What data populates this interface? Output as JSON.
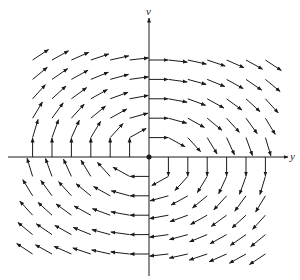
{
  "diagram": {
    "type": "vector_field",
    "title": "",
    "axes": {
      "horizontal_label": "y",
      "vertical_label": "v"
    },
    "colors": {
      "background": "#ffffff",
      "ink": "#1a1a1a"
    }
  },
  "chart_data": {
    "type": "vector_field",
    "title": "",
    "xlabel": "y",
    "ylabel": "v",
    "origin_px": [
      149,
      157
    ],
    "grid_spacing_px": 19.4,
    "grid_x_range": [
      -6,
      6
    ],
    "grid_v_range": [
      -5,
      5
    ],
    "arrow_length_px": 19,
    "field": "dy/dt = v, dv/dt = -0.55*y (clockwise rotation, elliptical orbits)",
    "field_coefficients": {
      "a": 1.0,
      "b": -0.55
    },
    "center_point": [
      0,
      0
    ],
    "grid": false,
    "axis_extent_px": {
      "x": [
        8,
        288
      ],
      "y": [
        18,
        276
      ]
    }
  }
}
